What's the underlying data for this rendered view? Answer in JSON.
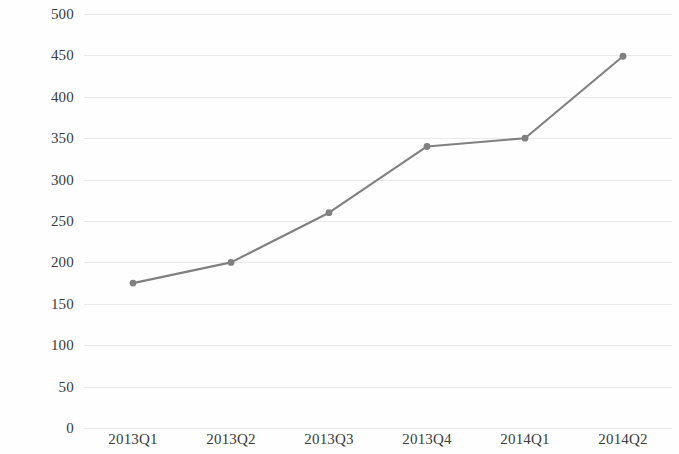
{
  "chart_data": {
    "type": "line",
    "title": "",
    "subtitle": "",
    "xlabel": "",
    "ylabel": "",
    "categories": [
      "2013Q1",
      "2013Q2",
      "2013Q3",
      "2013Q4",
      "2014Q1",
      "2014Q2"
    ],
    "values": [
      175,
      200,
      260,
      340,
      350,
      449
    ],
    "series": [
      {
        "name": "Series 1",
        "values": [
          175,
          200,
          260,
          340,
          350,
          449
        ]
      }
    ],
    "ylim": [
      0,
      500
    ],
    "y_ticks": [
      0,
      50,
      100,
      150,
      200,
      250,
      300,
      350,
      400,
      450,
      500
    ],
    "y_tick_labels": [
      "0",
      "50",
      "100",
      "150",
      "200",
      "250",
      "300",
      "350",
      "400",
      "450",
      "500"
    ],
    "grid": {
      "horizontal": true,
      "vertical": false,
      "color": "#e9e9e9"
    },
    "legend": {
      "visible": false,
      "position": "none",
      "entries": []
    },
    "annotations": [],
    "style": {
      "line_color": "#808080",
      "marker_color": "#808080",
      "marker_shape": "circle",
      "background_color": "#fefefe",
      "axis_text_color": "#3a3a3a"
    }
  }
}
